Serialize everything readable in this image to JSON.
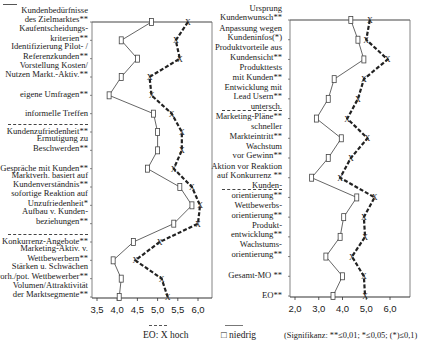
{
  "chart_data": [
    {
      "type": "line",
      "title": "",
      "orientation": "horizontal-profile",
      "xlabel": "",
      "ylabel": "",
      "xlim": [
        3.5,
        6.0
      ],
      "xticks": [
        "3,5",
        "4,0",
        "4,5",
        "5,0",
        "5,5",
        "6,0"
      ],
      "grid": false,
      "categories": [
        "Kundenbedürfnisse des Zielmarktes**",
        "Kaufentscheidungs-kriterien**",
        "Identifizierung Pilot- / Referenzkunden**",
        "Vorstellung Kosten/ Nutzen Markt.-Aktiv.**",
        "eigene Umfragen**",
        "informelle Treffen",
        "Kundenzufriedenheit**",
        "Ermutigung zu Beschwerden**",
        "Gespräche mit Kunden**",
        "Marktverh. basiert auf Kundenverständnis**",
        "sofortige Reaktion auf Unzufriedenheit*",
        "Aufbau v. Kunden-beziehungen**",
        "Konkurrenz-Angebote**",
        "Marketing-Aktiv. v. Wettbewerbern**",
        "Stärken u. Schwächen vorh./pot. Wettbewerber**",
        "Volumen/Attraktivität der Marktsegmente**"
      ],
      "series": [
        {
          "name": "EO: X hoch",
          "style": "dashed",
          "marker": "X",
          "values": [
            5.75,
            5.45,
            5.55,
            4.8,
            4.85,
            5.35,
            5.6,
            5.6,
            5.4,
            5.85,
            6.05,
            6.0,
            5.05,
            4.45,
            5.1,
            5.25
          ]
        },
        {
          "name": "niedrig",
          "style": "solid",
          "marker": "square",
          "values": [
            4.85,
            4.1,
            4.5,
            4.1,
            3.8,
            4.9,
            5.0,
            5.0,
            4.75,
            5.55,
            5.85,
            5.4,
            4.4,
            3.9,
            4.1,
            4.05
          ]
        }
      ],
      "group_separators_after": [
        5,
        11
      ]
    },
    {
      "type": "line",
      "title": "",
      "orientation": "horizontal-profile",
      "xlabel": "",
      "ylabel": "",
      "xlim": [
        2.0,
        6.8
      ],
      "xticks": [
        "2,0",
        "3,0",
        "4,0",
        "5,0",
        "6,0"
      ],
      "grid": false,
      "categories": [
        "Ursprung Kundenwunsch**",
        "Anpassung wegen Kundeninfos(*)",
        "Produktvorteile aus Kundensicht**",
        "Produkttests mit Kunden**",
        "Entwicklung mit Lead Usern**",
        "untersch. Marketing-Pläne**",
        "schneller Markteintritt**",
        "Wachstum vor Gewinn**",
        "Aktion vor Reaktion auf Konkurrenz **",
        "Kunden-orientierung**",
        "Wettbewerbs-orientierung**",
        "Produkt-entwicklung**",
        "Wachstums-orientierung**",
        "Gesamt-MO **",
        "EO**"
      ],
      "series": [
        {
          "name": "EO: X hoch",
          "style": "dashed",
          "marker": "X",
          "values": [
            5.15,
            5.0,
            5.9,
            4.9,
            4.65,
            4.2,
            5.05,
            4.35,
            3.9,
            5.35,
            4.9,
            4.95,
            4.4,
            4.9,
            4.95
          ]
        },
        {
          "name": "niedrig",
          "style": "solid",
          "marker": "square",
          "values": [
            4.35,
            4.65,
            4.9,
            3.65,
            3.4,
            2.9,
            3.95,
            3.4,
            2.7,
            4.6,
            4.05,
            3.9,
            3.3,
            4.0,
            3.6
          ]
        }
      ],
      "group_separators_after": [
        4,
        8
      ]
    }
  ],
  "left_chart": {
    "labels": [
      [
        "Kundenbedürfnisse",
        "des Zielmarktes**"
      ],
      [
        "Kaufentscheidungs-",
        "kriterien**"
      ],
      [
        "Identifizierung Pilot- /",
        "Referenzkunden**"
      ],
      [
        "Vorstellung Kosten/",
        "Nutzen Markt.-Aktiv.**"
      ],
      [
        "eigene Umfragen**"
      ],
      [
        "informelle Treffen"
      ],
      [
        "Kundenzufriedenheit**"
      ],
      [
        "Ermutigung zu",
        "Beschwerden**"
      ],
      [
        "Gespräche mit Kunden**"
      ],
      [
        "Marktverh. basiert auf",
        "Kundenverständnis**"
      ],
      [
        "sofortige Reaktion auf",
        "Unzufriedenheit*"
      ],
      [
        "Aufbau v. Kunden-",
        "beziehungen**"
      ],
      [
        "Konkurrenz-Angebote**"
      ],
      [
        "Marketing-Aktiv. v.",
        "Wettbewerbern**"
      ],
      [
        "Stärken u. Schwächen",
        "vorh./pot. Wettbewerber**"
      ],
      [
        "Volumen/Attraktivität",
        "der Marktsegmente**"
      ]
    ],
    "ticks": [
      "3,5",
      "4,0",
      "4,5",
      "5,0",
      "5,5",
      "6,0"
    ]
  },
  "right_chart": {
    "labels": [
      [
        "Ursprung",
        "Kundenwunsch**"
      ],
      [
        "Anpassung wegen",
        "Kundeninfos(*)"
      ],
      [
        "Produktvorteile aus",
        "Kundensicht**"
      ],
      [
        "Produkttests",
        "mit Kunden**"
      ],
      [
        "Entwicklung mit",
        "Lead Usern**"
      ],
      [
        "untersch.",
        "Marketing-Pläne**"
      ],
      [
        "schneller",
        "Markteintritt**"
      ],
      [
        "Wachstum",
        "vor Gewinn**"
      ],
      [
        "Aktion vor Reaktion",
        "auf Konkurrenz **"
      ],
      [
        "Kunden-",
        "orientierung**"
      ],
      [
        "Wettbewerbs-",
        "orientierung**"
      ],
      [
        "Produkt-",
        "entwicklung**"
      ],
      [
        "Wachstums-",
        "orientierung**"
      ],
      [
        "Gesamt-MO **"
      ],
      [
        "EO**"
      ]
    ],
    "ticks": [
      "2,0",
      "3,0",
      "4,0",
      "5,0",
      "6,0"
    ]
  },
  "legend": {
    "high": "EO:  X hoch",
    "low": "□ niedrig",
    "significance": "(Signifikanz: **≤0,01; *≤0,05; (*)≤0,1)"
  }
}
